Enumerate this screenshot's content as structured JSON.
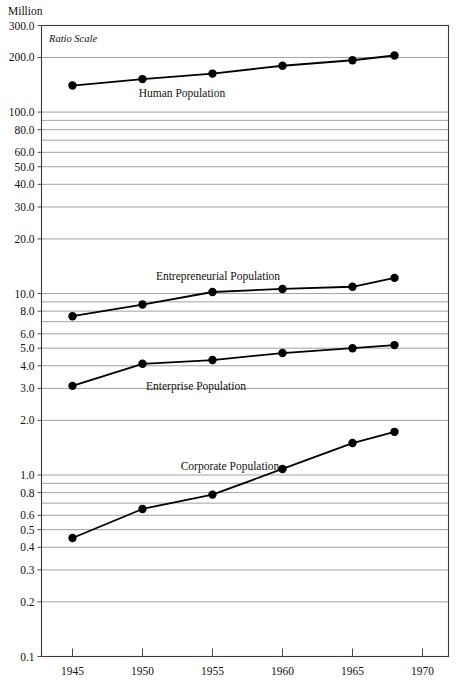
{
  "axes": {
    "unit_label": "Million",
    "ratio_scale_note": "Ratio Scale",
    "y_tick_labels": [
      "300.0",
      "200.0",
      "100.0",
      "80.0",
      "60.0",
      "50.0",
      "40.0",
      "30.0",
      "20.0",
      "10.0",
      "8.0",
      "6.0",
      "5.0",
      "4.0",
      "3.0",
      "2.0",
      "1.0",
      "0.8",
      "0.6",
      "0.5",
      "0.4",
      "0.3",
      "0.2",
      "0.1"
    ],
    "x_tick_labels": [
      "1945",
      "1950",
      "1955",
      "1960",
      "1965",
      "1970"
    ]
  },
  "series_labels": {
    "human": "Human Population",
    "entrepreneurial": "Entrepreneurial Population",
    "enterprise": "Enterprise Population",
    "corporate": "Corporate Population"
  },
  "colors": {
    "line": "#000000",
    "grid": "#8a8a8a",
    "frame": "#3a3a3a",
    "text": "#111111"
  },
  "chart_data": {
    "type": "line",
    "title": "",
    "subtitle": "",
    "xlabel": "",
    "ylabel": "Million",
    "yscale": "log",
    "ylim": [
      0.1,
      300
    ],
    "xlim": [
      1943,
      1971.5
    ],
    "grid": true,
    "legend": "inline-annotations",
    "annotations": [
      "Ratio Scale"
    ],
    "x": [
      1945,
      1950,
      1955,
      1960,
      1965,
      1968
    ],
    "series": [
      {
        "name": "Human Population",
        "values": [
          140,
          152,
          163,
          180,
          193,
          205
        ]
      },
      {
        "name": "Entrepreneurial Population",
        "values": [
          7.5,
          8.7,
          10.2,
          10.6,
          10.9,
          12.2
        ]
      },
      {
        "name": "Enterprise Population",
        "values": [
          3.1,
          4.1,
          4.3,
          4.7,
          5.0,
          5.2
        ]
      },
      {
        "name": "Corporate Population",
        "values": [
          0.45,
          0.65,
          0.78,
          1.08,
          1.5,
          1.73
        ]
      }
    ],
    "y_major_ticks": [
      300,
      200,
      100,
      80,
      60,
      50,
      40,
      30,
      20,
      10,
      8,
      6,
      5,
      4,
      3,
      2,
      1,
      0.8,
      0.6,
      0.5,
      0.4,
      0.3,
      0.2,
      0.1
    ],
    "y_gridlines": [
      200,
      100,
      90,
      80,
      70,
      60,
      50,
      40,
      30,
      20,
      10,
      9,
      8,
      7,
      6,
      5,
      4,
      3,
      2,
      1,
      0.9,
      0.8,
      0.7,
      0.6,
      0.5,
      0.4,
      0.3,
      0.2
    ],
    "x_ticks": [
      1945,
      1950,
      1955,
      1960,
      1965,
      1970
    ]
  }
}
